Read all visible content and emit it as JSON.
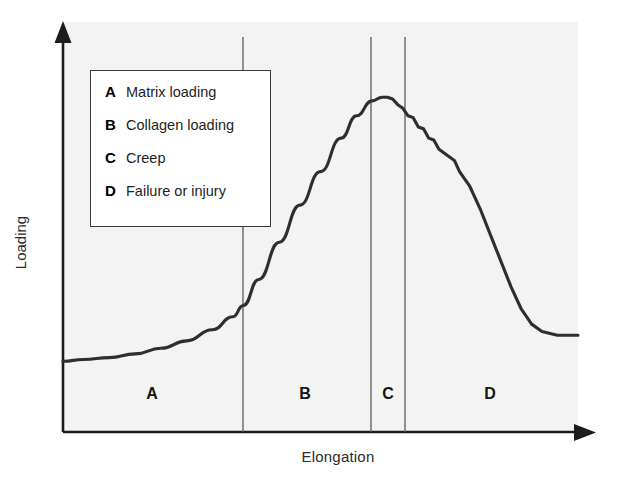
{
  "chart_data": {
    "type": "line",
    "title": "",
    "xlabel": "Elongation",
    "ylabel": "Loading",
    "grid": false,
    "legend_position": "inside-top-left",
    "axis_style": "arrows",
    "xlim": [
      0,
      100
    ],
    "ylim": [
      0,
      100
    ],
    "x_tick_labels": [],
    "y_tick_labels": [],
    "annotations": [
      "A",
      "B",
      "C",
      "D"
    ],
    "region_dividers_x": [
      35,
      60,
      67
    ],
    "regions": [
      {
        "key": "A",
        "label": "Matrix loading",
        "x_start": 0,
        "x_end": 35,
        "center_x": 17.5
      },
      {
        "key": "B",
        "label": "Collagen loading",
        "x_start": 35,
        "x_end": 60,
        "center_x": 47.5
      },
      {
        "key": "C",
        "label": "Creep",
        "x_start": 60,
        "x_end": 67,
        "center_x": 63.5
      },
      {
        "key": "D",
        "label": "Failure or injury",
        "x_start": 67,
        "x_end": 100,
        "center_x": 83
      }
    ],
    "series": [
      {
        "name": "Load-elongation response",
        "x": [
          0,
          4,
          9,
          14,
          19,
          24,
          29,
          33,
          35,
          38,
          42,
          46,
          50,
          54,
          57,
          60,
          62,
          63,
          64,
          65,
          66,
          67,
          68,
          69,
          70,
          71,
          72,
          73,
          74,
          75,
          76,
          77,
          79,
          81,
          83,
          85,
          87,
          89,
          91,
          93,
          96,
          100
        ],
        "y": [
          19,
          19.5,
          20,
          21,
          22.5,
          24.5,
          27.5,
          31,
          34,
          41,
          51,
          61,
          70,
          79,
          85,
          89,
          90,
          90,
          89.5,
          88,
          87,
          85,
          84.5,
          82,
          81.5,
          79,
          78.5,
          76,
          75,
          74,
          73,
          70,
          66,
          60,
          53,
          46,
          39,
          33,
          29,
          27,
          26,
          26
        ]
      }
    ]
  },
  "legend": {
    "items": [
      {
        "key": "A",
        "label": "Matrix loading"
      },
      {
        "key": "B",
        "label": "Collagen loading"
      },
      {
        "key": "C",
        "label": "Creep"
      },
      {
        "key": "D",
        "label": "Failure or injury"
      }
    ]
  },
  "axes": {
    "y_title": "Loading",
    "x_title": "Elongation"
  },
  "region_markers": [
    {
      "key": "A"
    },
    {
      "key": "B"
    },
    {
      "key": "C"
    },
    {
      "key": "D"
    }
  ],
  "colors": {
    "curve": "#2e2e2e",
    "axis": "#1c1c1c",
    "panel_background": "#f3f3f3",
    "divider": "#5a5a5a",
    "legend_border": "#3a3a3a",
    "text": "#1d1d1d"
  }
}
